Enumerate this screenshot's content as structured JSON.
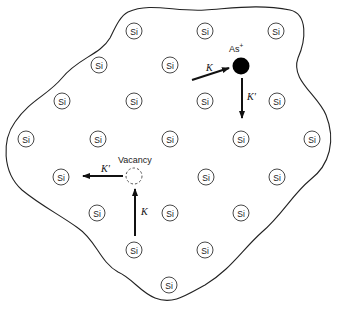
{
  "diagram": {
    "atom_label": "Si",
    "si_atoms": [
      {
        "row": 1,
        "col": 1
      },
      {
        "row": 1,
        "col": 2
      },
      {
        "row": 1,
        "col": 3
      },
      {
        "row": 2,
        "col": 1
      },
      {
        "row": 2,
        "col": 2
      },
      {
        "row": 3,
        "col": 1
      },
      {
        "row": 3,
        "col": 2
      },
      {
        "row": 3,
        "col": 3
      },
      {
        "row": 3,
        "col": 4
      },
      {
        "row": 4,
        "col": 1
      },
      {
        "row": 4,
        "col": 2
      },
      {
        "row": 4,
        "col": 3
      },
      {
        "row": 4,
        "col": 4
      },
      {
        "row": 4,
        "col": 5
      },
      {
        "row": 5,
        "col": 1
      },
      {
        "row": 5,
        "col": 2
      },
      {
        "row": 5,
        "col": 3
      },
      {
        "row": 6,
        "col": 1
      },
      {
        "row": 6,
        "col": 2
      },
      {
        "row": 6,
        "col": 3
      },
      {
        "row": 7,
        "col": 1
      },
      {
        "row": 7,
        "col": 2
      },
      {
        "row": 8,
        "col": 1
      }
    ],
    "dopant": {
      "label": "As",
      "charge": "+"
    },
    "vacancy": {
      "label": "Vacancy"
    },
    "arrows": [
      {
        "id": "as-in",
        "label": "K",
        "target": "dopant"
      },
      {
        "id": "as-out",
        "label": "K'",
        "source": "dopant"
      },
      {
        "id": "vac-in",
        "label": "K",
        "target": "vacancy"
      },
      {
        "id": "vac-out",
        "label": "K'",
        "source": "vacancy"
      }
    ],
    "colors": {
      "line": "#222222",
      "dopant_fill": "#000000",
      "background": "#ffffff"
    }
  }
}
